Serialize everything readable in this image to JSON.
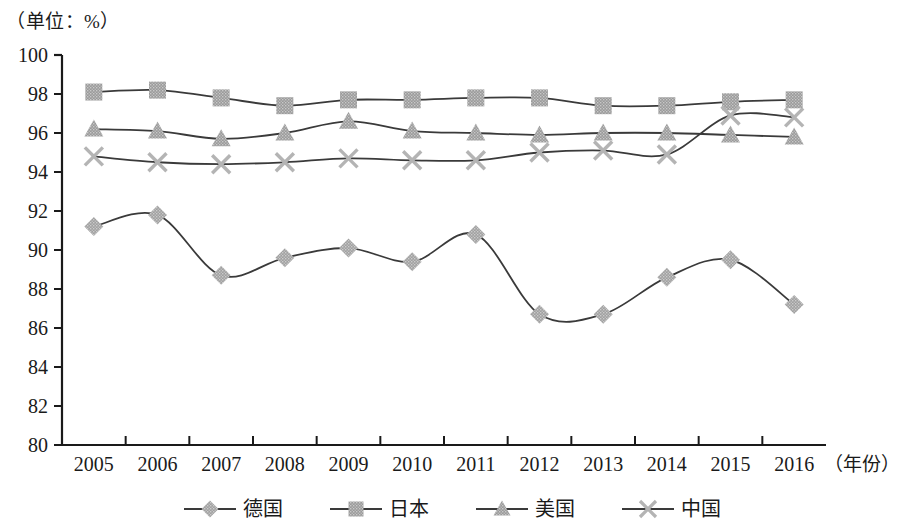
{
  "chart_data": {
    "type": "line",
    "title": "（单位：%）",
    "subtitle": "",
    "xlabel": "（年份）",
    "ylabel": "",
    "categories": [
      "2005",
      "2006",
      "2007",
      "2008",
      "2009",
      "2010",
      "2011",
      "2012",
      "2013",
      "2014",
      "2015",
      "2016"
    ],
    "ylim": [
      80,
      100
    ],
    "ytick_step": 2,
    "yticks": [
      "100",
      "98",
      "96",
      "94",
      "92",
      "90",
      "88",
      "86",
      "84",
      "82",
      "80"
    ],
    "grid": false,
    "legend_position": "bottom",
    "series": [
      {
        "name": "德国",
        "marker": "diamond",
        "color": "#a0a0a0",
        "line_color": "#3a3a3a",
        "values": [
          91.2,
          91.8,
          88.7,
          89.6,
          90.1,
          89.4,
          90.8,
          86.7,
          86.7,
          88.6,
          89.5,
          87.2
        ]
      },
      {
        "name": "日本",
        "marker": "square",
        "color": "#9a9a9a",
        "line_color": "#3a3a3a",
        "values": [
          98.1,
          98.2,
          97.8,
          97.4,
          97.7,
          97.7,
          97.8,
          97.8,
          97.4,
          97.4,
          97.6,
          97.7
        ]
      },
      {
        "name": "美国",
        "marker": "triangle",
        "color": "#9a9a9a",
        "line_color": "#3a3a3a",
        "values": [
          96.2,
          96.1,
          95.7,
          96.0,
          96.6,
          96.1,
          96.0,
          95.9,
          96.0,
          96.0,
          95.9,
          95.8
        ]
      },
      {
        "name": "中国",
        "marker": "x-cross",
        "color": "#b4b4b4",
        "line_color": "#3a3a3a",
        "values": [
          94.8,
          94.5,
          94.4,
          94.5,
          94.7,
          94.6,
          94.6,
          95.0,
          95.1,
          94.9,
          96.9,
          96.8
        ]
      }
    ]
  },
  "axis": {
    "axis_line_color": "#1a1a1a",
    "tick_color": "#1a1a1a"
  }
}
